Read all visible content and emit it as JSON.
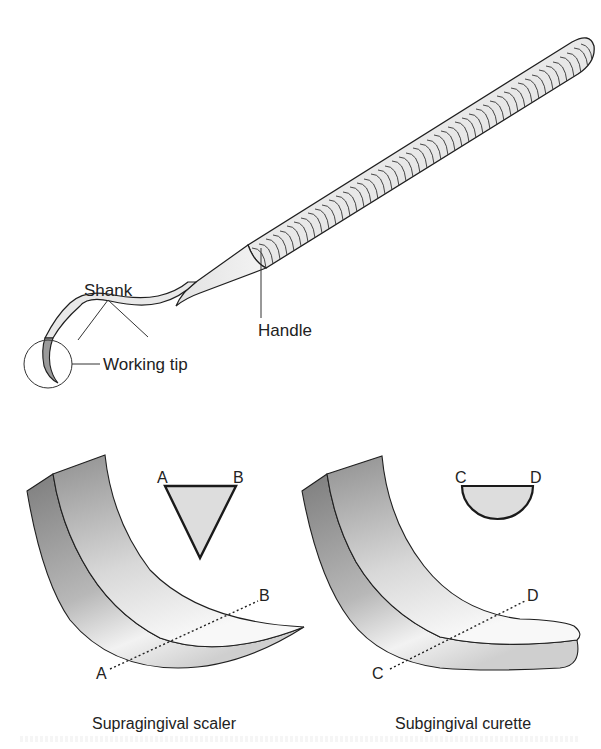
{
  "figure": {
    "instrument": {
      "labels": {
        "shank": "Shank",
        "handle": "Handle",
        "working_tip": "Working tip"
      }
    },
    "scaler": {
      "caption": "Supragingival scaler",
      "cross_section_shape": "triangle",
      "section_points": {
        "start": "A",
        "end": "B"
      },
      "cross_section_labels": {
        "left": "A",
        "right": "B"
      }
    },
    "curette": {
      "caption": "Subgingival curette",
      "cross_section_shape": "half-circle",
      "section_points": {
        "start": "C",
        "end": "D"
      },
      "cross_section_labels": {
        "left": "C",
        "right": "D"
      }
    },
    "colors": {
      "line": "#1f1f1f",
      "fill_light": "#e6e6e6",
      "fill_dark": "#8a8a8a",
      "background": "#ffffff"
    }
  }
}
